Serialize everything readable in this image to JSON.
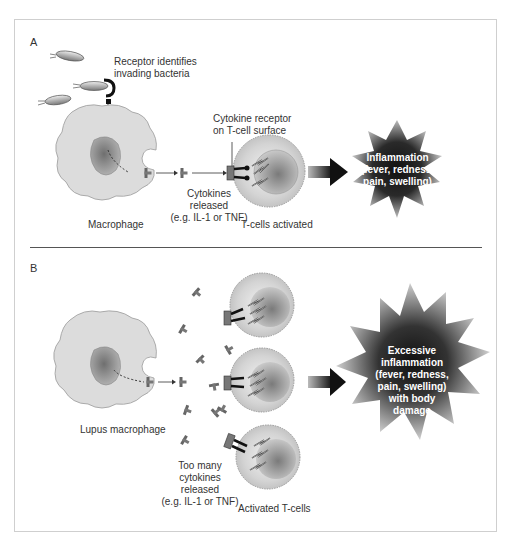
{
  "figure": {
    "panels": [
      {
        "id": "A",
        "label": "A",
        "labels": {
          "receptor": [
            "Receptor identifies",
            "invading bacteria"
          ],
          "cytokine_receptor": [
            "Cytokine receptor",
            "on T-cell surface"
          ],
          "cytokines": [
            "Cytokines",
            "released",
            "(e.g. IL-1 or TNF)"
          ],
          "macrophage": "Macrophage",
          "tcells": "T-cells activated",
          "outcome": [
            "Inflammation",
            "(fever, redness,",
            "pain, swelling)"
          ]
        }
      },
      {
        "id": "B",
        "label": "B",
        "labels": {
          "macrophage": "Lupus macrophage",
          "cytokines": [
            "Too many",
            "cytokines",
            "released",
            "(e.g. IL-1 or TNF)"
          ],
          "tcells": "Activated T-cells",
          "outcome": [
            "Excessive",
            "inflammation",
            "(fever, redness,",
            "pain, swelling)",
            "with body",
            "damage"
          ]
        }
      }
    ],
    "colors": {
      "cell_fill": "#d9d9d9",
      "nucleus": "#8a8a8a",
      "star_dark": "#1a1a1a",
      "frame": "#cfcfcf",
      "text": "#333333"
    }
  }
}
